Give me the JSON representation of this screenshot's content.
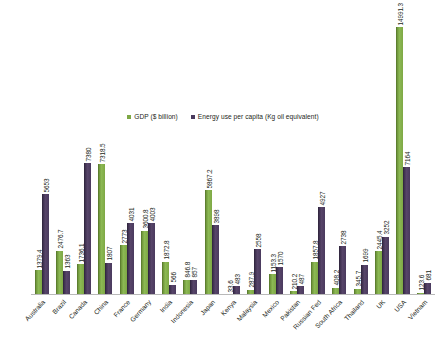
{
  "chart_data": {
    "type": "bar",
    "title": "",
    "subtitle": "",
    "xlabel": "",
    "ylabel": "",
    "ylim": [
      0,
      15500
    ],
    "grid": false,
    "legend_position": "top-center",
    "categories": [
      "Australia",
      "Brazil",
      "Canada",
      "China",
      "France",
      "Germany",
      "India",
      "Indonesia",
      "Japan",
      "Kenya",
      "Malaysia",
      "Mexico",
      "Pakistan",
      "Russian Fed",
      "South Africa",
      "Thailand",
      "UK",
      "USA",
      "Vietnam"
    ],
    "series": [
      {
        "name": "GDP ($ billion)",
        "color": "#7EA845",
        "values": [
          1379.4,
          2476.7,
          1736.1,
          7318.5,
          2773,
          3600.8,
          1872.8,
          846.8,
          5867.2,
          33.6,
          287.9,
          1153.3,
          210.2,
          1857.8,
          408.2,
          345.7,
          2445.4,
          14991.3,
          123.6
        ],
        "labels": [
          "1379.4",
          "2476.7",
          "1736.1",
          "7318.5",
          "2773",
          "3600.8",
          "1872.8",
          "846.8",
          "5867.2",
          "33.6",
          "287.9",
          "1153.3",
          "210.2",
          "1857.8",
          "408.2",
          "345.7",
          "2445.4",
          "14991.3",
          "123.6"
        ]
      },
      {
        "name": "Energy use per capita (Kg oil equivalent)",
        "color": "#4A3A5E",
        "values": [
          5653,
          1363,
          7380,
          1807,
          4031,
          4003,
          566,
          857,
          3898,
          483,
          2558,
          1570,
          487,
          4927,
          2738,
          1699,
          3252,
          7164,
          681
        ],
        "labels": [
          "5653",
          "1363",
          "7380",
          "1807",
          "4031",
          "4003",
          "566",
          "857",
          "3898",
          "483",
          "2558",
          "1570",
          "487",
          "4927",
          "2738",
          "1699",
          "3252",
          "7164",
          "681"
        ]
      }
    ]
  }
}
